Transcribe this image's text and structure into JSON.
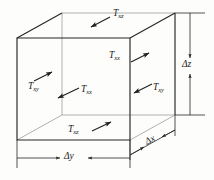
{
  "figure": {
    "kind": "stress-element-cube",
    "background_color": "#fdfdfb",
    "line_color_front": "#2b2b2b",
    "line_color_hidden": "#9a9a9a",
    "text_color": "#1a1a1a"
  },
  "stress_labels": [
    {
      "id": "tau-xz-top",
      "symbol": "T",
      "sub": "xz",
      "x": 113,
      "y": 14
    },
    {
      "id": "tau-xx-upper",
      "symbol": "T",
      "sub": "xx",
      "x": 114,
      "y": 56
    },
    {
      "id": "tau-xy-left",
      "symbol": "T",
      "sub": "xy",
      "x": 32,
      "y": 86
    },
    {
      "id": "tau-xx-mid",
      "symbol": "T",
      "sub": "xx",
      "x": 83,
      "y": 90
    },
    {
      "id": "tau-xy-right",
      "symbol": "T",
      "sub": "xy",
      "x": 155,
      "y": 87
    },
    {
      "id": "tau-xz-bottom",
      "symbol": "T",
      "sub": "xz",
      "x": 71,
      "y": 129
    }
  ],
  "dimension_labels": [
    {
      "id": "delta-z",
      "delta": "Δ",
      "axis": "z",
      "x": 186,
      "y": 66
    },
    {
      "id": "delta-y",
      "delta": "Δ",
      "axis": "y",
      "x": 69,
      "y": 158
    },
    {
      "id": "delta-x",
      "delta": "Δ",
      "axis": "x",
      "x": 151,
      "y": 144
    }
  ],
  "geometry": {
    "front_face": {
      "left": 17,
      "right": 130,
      "top": 38,
      "bottom": 140
    },
    "depth_offset": {
      "dx": 45,
      "dy": -25
    }
  }
}
